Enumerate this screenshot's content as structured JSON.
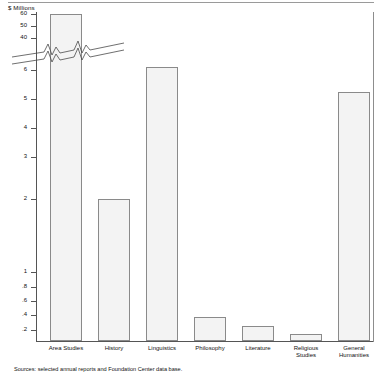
{
  "chart_data": {
    "type": "bar",
    "title": "",
    "ylabel": "$ Millions",
    "xlabel": "",
    "categories": [
      "Area Studies",
      "History",
      "Linguistics",
      "Philosophy",
      "Literature",
      "Religious\nStudies",
      "General\nHumanities"
    ],
    "values": [
      60,
      2.0,
      6.3,
      0.36,
      0.24,
      0.07,
      5.2
    ],
    "axis_break": true,
    "grid": false,
    "legend": "none",
    "ytick_labels": [
      "60",
      "50",
      "40",
      "6",
      "5",
      "4",
      "3",
      "2",
      "1",
      ".8",
      ".6",
      ".4",
      ".2"
    ],
    "ytick_values": [
      60,
      50,
      40,
      6,
      5,
      4,
      3,
      2,
      1,
      0.8,
      0.6,
      0.4,
      0.2
    ],
    "ylim_upper_segment": [
      40,
      60
    ],
    "ylim_lower_segment": [
      0,
      6
    ],
    "source_note": "Sources: selected annual reports and Foundation Center data base."
  },
  "axis": {
    "y_title": "$ Millions",
    "ticks": [
      {
        "label": "60",
        "y": 14
      },
      {
        "label": "50",
        "y": 26
      },
      {
        "label": "40",
        "y": 38
      },
      {
        "label": "6",
        "y": 70
      },
      {
        "label": "5",
        "y": 99
      },
      {
        "label": "4",
        "y": 128
      },
      {
        "label": "3",
        "y": 157
      },
      {
        "label": "2",
        "y": 199
      },
      {
        "label": "1",
        "y": 272
      },
      {
        "label": ".8",
        "y": 287
      },
      {
        "label": ".6",
        "y": 301
      },
      {
        "label": ".4",
        "y": 315
      },
      {
        "label": ".2",
        "y": 330
      }
    ]
  },
  "bars": [
    {
      "label": "Area Studies",
      "left": 14,
      "width": 32,
      "top": 14,
      "value": "60"
    },
    {
      "label": "History",
      "left": 62,
      "width": 32,
      "top": 199,
      "value": "2.0"
    },
    {
      "label": "Linguistics",
      "left": 110,
      "width": 32,
      "top": 67,
      "value": "6.3"
    },
    {
      "label": "Philosophy",
      "left": 158,
      "width": 32,
      "top": 317,
      "value": ".36"
    },
    {
      "label": "Literature",
      "left": 206,
      "width": 32,
      "top": 326,
      "value": ".24"
    },
    {
      "label": "Religious\nStudies",
      "left": 254,
      "width": 32,
      "top": 334,
      "value": ".07"
    },
    {
      "label": "General\nHumanities",
      "left": 302,
      "width": 32,
      "top": 92,
      "value": "5.2"
    }
  ],
  "source": "Sources: selected annual reports and Foundation Center data base."
}
